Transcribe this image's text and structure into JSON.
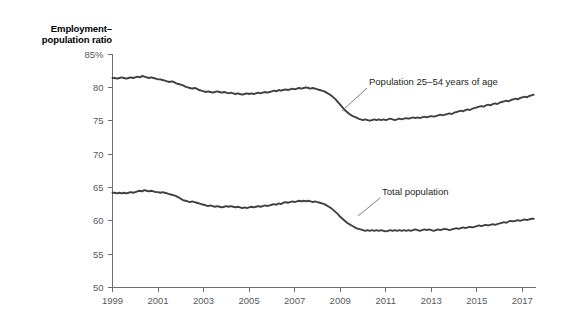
{
  "chart_data": {
    "type": "line",
    "title": "",
    "ylabel": "Employment–population ratio",
    "xlabel": "",
    "ylim": [
      50,
      85
    ],
    "xlim": [
      1999,
      2017.6
    ],
    "grid": false,
    "legend_position": "inline-annotations",
    "y_ticks": [
      "85%",
      "80",
      "75",
      "70",
      "65",
      "60",
      "55",
      "50"
    ],
    "y_tick_values": [
      85,
      80,
      75,
      70,
      65,
      60,
      55,
      50
    ],
    "x_ticks": [
      "1999",
      "2001",
      "2003",
      "2005",
      "2007",
      "2009",
      "2011",
      "2013",
      "2015",
      "2017"
    ],
    "x_tick_values": [
      1999,
      2001,
      2003,
      2005,
      2007,
      2009,
      2011,
      2013,
      2015,
      2017
    ],
    "series": [
      {
        "name": "Population 25–54 years of age",
        "annotation": "Population 25–54 years of age",
        "color": "#3f3f3f",
        "x": [
          1999.0,
          1999.1,
          1999.2,
          1999.3,
          1999.4,
          1999.5,
          1999.6,
          1999.7,
          1999.8,
          1999.9,
          2000.0,
          2000.1,
          2000.2,
          2000.3,
          2000.4,
          2000.5,
          2000.6,
          2000.7,
          2000.8,
          2000.9,
          2001.0,
          2001.1,
          2001.2,
          2001.3,
          2001.4,
          2001.5,
          2001.6,
          2001.7,
          2001.8,
          2001.9,
          2002.0,
          2002.1,
          2002.2,
          2002.3,
          2002.4,
          2002.5,
          2002.6,
          2002.7,
          2002.8,
          2002.9,
          2003.0,
          2003.1,
          2003.2,
          2003.3,
          2003.4,
          2003.5,
          2003.6,
          2003.7,
          2003.8,
          2003.9,
          2004.0,
          2004.1,
          2004.2,
          2004.3,
          2004.4,
          2004.5,
          2004.6,
          2004.7,
          2004.8,
          2004.9,
          2005.0,
          2005.1,
          2005.2,
          2005.3,
          2005.4,
          2005.5,
          2005.6,
          2005.7,
          2005.8,
          2005.9,
          2006.0,
          2006.1,
          2006.2,
          2006.3,
          2006.4,
          2006.5,
          2006.6,
          2006.7,
          2006.8,
          2006.9,
          2007.0,
          2007.1,
          2007.2,
          2007.3,
          2007.4,
          2007.5,
          2007.6,
          2007.7,
          2007.8,
          2007.9,
          2008.0,
          2008.1,
          2008.2,
          2008.3,
          2008.4,
          2008.5,
          2008.6,
          2008.7,
          2008.8,
          2008.9,
          2009.0,
          2009.1,
          2009.2,
          2009.3,
          2009.4,
          2009.5,
          2009.6,
          2009.7,
          2009.8,
          2009.9,
          2010.0,
          2010.1,
          2010.2,
          2010.3,
          2010.4,
          2010.5,
          2010.6,
          2010.7,
          2010.8,
          2010.9,
          2011.0,
          2011.1,
          2011.2,
          2011.3,
          2011.4,
          2011.5,
          2011.6,
          2011.7,
          2011.8,
          2011.9,
          2012.0,
          2012.1,
          2012.2,
          2012.3,
          2012.4,
          2012.5,
          2012.6,
          2012.7,
          2012.8,
          2012.9,
          2013.0,
          2013.1,
          2013.2,
          2013.3,
          2013.4,
          2013.5,
          2013.6,
          2013.7,
          2013.8,
          2013.9,
          2014.0,
          2014.1,
          2014.2,
          2014.3,
          2014.4,
          2014.5,
          2014.6,
          2014.7,
          2014.8,
          2014.9,
          2015.0,
          2015.1,
          2015.2,
          2015.3,
          2015.4,
          2015.5,
          2015.6,
          2015.7,
          2015.8,
          2015.9,
          2016.0,
          2016.1,
          2016.2,
          2016.3,
          2016.4,
          2016.5,
          2016.6,
          2016.7,
          2016.8,
          2016.9,
          2017.0,
          2017.1,
          2017.2,
          2017.3,
          2017.4,
          2017.5
        ],
        "values": [
          81.4,
          81.4,
          81.3,
          81.4,
          81.5,
          81.4,
          81.3,
          81.4,
          81.5,
          81.4,
          81.5,
          81.6,
          81.5,
          81.7,
          81.6,
          81.5,
          81.4,
          81.5,
          81.4,
          81.3,
          81.2,
          81.2,
          81.1,
          81.0,
          80.9,
          80.8,
          80.9,
          80.8,
          80.6,
          80.5,
          80.4,
          80.3,
          80.1,
          80.0,
          79.9,
          79.8,
          79.9,
          79.8,
          79.6,
          79.5,
          79.4,
          79.3,
          79.4,
          79.3,
          79.2,
          79.3,
          79.4,
          79.3,
          79.2,
          79.3,
          79.2,
          79.1,
          79.2,
          79.1,
          79.0,
          79.1,
          79.0,
          78.9,
          79.0,
          79.1,
          79.0,
          79.1,
          79.0,
          79.1,
          79.2,
          79.1,
          79.2,
          79.3,
          79.2,
          79.3,
          79.4,
          79.5,
          79.4,
          79.6,
          79.5,
          79.6,
          79.7,
          79.6,
          79.7,
          79.8,
          79.7,
          79.8,
          79.9,
          79.8,
          79.9,
          80.0,
          79.9,
          79.8,
          79.9,
          79.8,
          79.7,
          79.6,
          79.5,
          79.4,
          79.2,
          79.0,
          78.8,
          78.5,
          78.2,
          77.8,
          77.4,
          77.0,
          76.6,
          76.3,
          76.0,
          75.8,
          75.6,
          75.5,
          75.3,
          75.2,
          75.1,
          75.2,
          75.1,
          75.0,
          75.1,
          75.2,
          75.1,
          75.2,
          75.1,
          75.2,
          75.1,
          75.2,
          75.3,
          75.2,
          75.1,
          75.2,
          75.3,
          75.2,
          75.3,
          75.4,
          75.3,
          75.4,
          75.5,
          75.4,
          75.5,
          75.4,
          75.5,
          75.6,
          75.5,
          75.6,
          75.7,
          75.6,
          75.7,
          75.8,
          75.9,
          75.8,
          75.9,
          76.0,
          76.1,
          76.0,
          76.2,
          76.3,
          76.4,
          76.5,
          76.4,
          76.6,
          76.7,
          76.6,
          76.8,
          76.9,
          77.0,
          77.1,
          77.2,
          77.1,
          77.3,
          77.4,
          77.3,
          77.5,
          77.6,
          77.5,
          77.7,
          77.8,
          77.9,
          78.0,
          77.9,
          78.1,
          78.2,
          78.3,
          78.2,
          78.4,
          78.5,
          78.6,
          78.5,
          78.7,
          78.8,
          78.9
        ]
      },
      {
        "name": "Total population",
        "annotation": "Total population",
        "color": "#3f3f3f",
        "x": [
          1999.0,
          1999.1,
          1999.2,
          1999.3,
          1999.4,
          1999.5,
          1999.6,
          1999.7,
          1999.8,
          1999.9,
          2000.0,
          2000.1,
          2000.2,
          2000.3,
          2000.4,
          2000.5,
          2000.6,
          2000.7,
          2000.8,
          2000.9,
          2001.0,
          2001.1,
          2001.2,
          2001.3,
          2001.4,
          2001.5,
          2001.6,
          2001.7,
          2001.8,
          2001.9,
          2002.0,
          2002.1,
          2002.2,
          2002.3,
          2002.4,
          2002.5,
          2002.6,
          2002.7,
          2002.8,
          2002.9,
          2003.0,
          2003.1,
          2003.2,
          2003.3,
          2003.4,
          2003.5,
          2003.6,
          2003.7,
          2003.8,
          2003.9,
          2004.0,
          2004.1,
          2004.2,
          2004.3,
          2004.4,
          2004.5,
          2004.6,
          2004.7,
          2004.8,
          2004.9,
          2005.0,
          2005.1,
          2005.2,
          2005.3,
          2005.4,
          2005.5,
          2005.6,
          2005.7,
          2005.8,
          2005.9,
          2006.0,
          2006.1,
          2006.2,
          2006.3,
          2006.4,
          2006.5,
          2006.6,
          2006.7,
          2006.8,
          2006.9,
          2007.0,
          2007.1,
          2007.2,
          2007.3,
          2007.4,
          2007.5,
          2007.6,
          2007.7,
          2007.8,
          2007.9,
          2008.0,
          2008.1,
          2008.2,
          2008.3,
          2008.4,
          2008.5,
          2008.6,
          2008.7,
          2008.8,
          2008.9,
          2009.0,
          2009.1,
          2009.2,
          2009.3,
          2009.4,
          2009.5,
          2009.6,
          2009.7,
          2009.8,
          2009.9,
          2010.0,
          2010.1,
          2010.2,
          2010.3,
          2010.4,
          2010.5,
          2010.6,
          2010.7,
          2010.8,
          2010.9,
          2011.0,
          2011.1,
          2011.2,
          2011.3,
          2011.4,
          2011.5,
          2011.6,
          2011.7,
          2011.8,
          2011.9,
          2012.0,
          2012.1,
          2012.2,
          2012.3,
          2012.4,
          2012.5,
          2012.6,
          2012.7,
          2012.8,
          2012.9,
          2013.0,
          2013.1,
          2013.2,
          2013.3,
          2013.4,
          2013.5,
          2013.6,
          2013.7,
          2013.8,
          2013.9,
          2014.0,
          2014.1,
          2014.2,
          2014.3,
          2014.4,
          2014.5,
          2014.6,
          2014.7,
          2014.8,
          2014.9,
          2015.0,
          2015.1,
          2015.2,
          2015.3,
          2015.4,
          2015.5,
          2015.6,
          2015.7,
          2015.8,
          2015.9,
          2016.0,
          2016.1,
          2016.2,
          2016.3,
          2016.4,
          2016.5,
          2016.6,
          2016.7,
          2016.8,
          2016.9,
          2017.0,
          2017.1,
          2017.2,
          2017.3,
          2017.4,
          2017.5
        ],
        "values": [
          64.2,
          64.2,
          64.1,
          64.2,
          64.1,
          64.2,
          64.1,
          64.2,
          64.3,
          64.2,
          64.3,
          64.4,
          64.5,
          64.4,
          64.6,
          64.5,
          64.4,
          64.5,
          64.4,
          64.3,
          64.3,
          64.2,
          64.3,
          64.2,
          64.1,
          64.0,
          63.9,
          63.8,
          63.7,
          63.5,
          63.3,
          63.1,
          63.0,
          62.9,
          62.8,
          62.9,
          62.8,
          62.7,
          62.6,
          62.5,
          62.4,
          62.3,
          62.2,
          62.3,
          62.2,
          62.1,
          62.2,
          62.1,
          62.0,
          62.1,
          62.2,
          62.1,
          62.2,
          62.1,
          62.0,
          62.1,
          62.0,
          61.9,
          62.0,
          61.9,
          62.0,
          62.1,
          62.0,
          62.1,
          62.2,
          62.1,
          62.2,
          62.3,
          62.2,
          62.3,
          62.4,
          62.5,
          62.4,
          62.6,
          62.5,
          62.7,
          62.8,
          62.7,
          62.8,
          62.9,
          62.8,
          62.9,
          63.0,
          62.9,
          63.0,
          62.9,
          63.0,
          62.9,
          62.8,
          62.9,
          62.8,
          62.7,
          62.6,
          62.5,
          62.3,
          62.1,
          61.9,
          61.6,
          61.3,
          61.0,
          60.6,
          60.3,
          60.0,
          59.7,
          59.5,
          59.3,
          59.1,
          58.9,
          58.8,
          58.7,
          58.6,
          58.5,
          58.6,
          58.5,
          58.6,
          58.5,
          58.6,
          58.5,
          58.6,
          58.5,
          58.4,
          58.5,
          58.6,
          58.5,
          58.6,
          58.5,
          58.6,
          58.5,
          58.6,
          58.5,
          58.6,
          58.5,
          58.6,
          58.7,
          58.6,
          58.5,
          58.6,
          58.7,
          58.6,
          58.7,
          58.6,
          58.5,
          58.6,
          58.7,
          58.6,
          58.7,
          58.8,
          58.7,
          58.6,
          58.7,
          58.8,
          58.9,
          58.8,
          58.9,
          59.0,
          58.9,
          59.0,
          59.1,
          59.0,
          59.1,
          59.2,
          59.3,
          59.2,
          59.3,
          59.4,
          59.3,
          59.4,
          59.5,
          59.4,
          59.5,
          59.6,
          59.7,
          59.8,
          59.7,
          59.9,
          60.0,
          59.9,
          60.0,
          60.1,
          60.0,
          60.1,
          60.2,
          60.1,
          60.2,
          60.3,
          60.3
        ]
      }
    ],
    "annotations": [
      {
        "text": "Population 25–54 years of age",
        "x": 369,
        "y": 85
      },
      {
        "text": "Total population",
        "x": 382,
        "y": 195
      }
    ]
  }
}
